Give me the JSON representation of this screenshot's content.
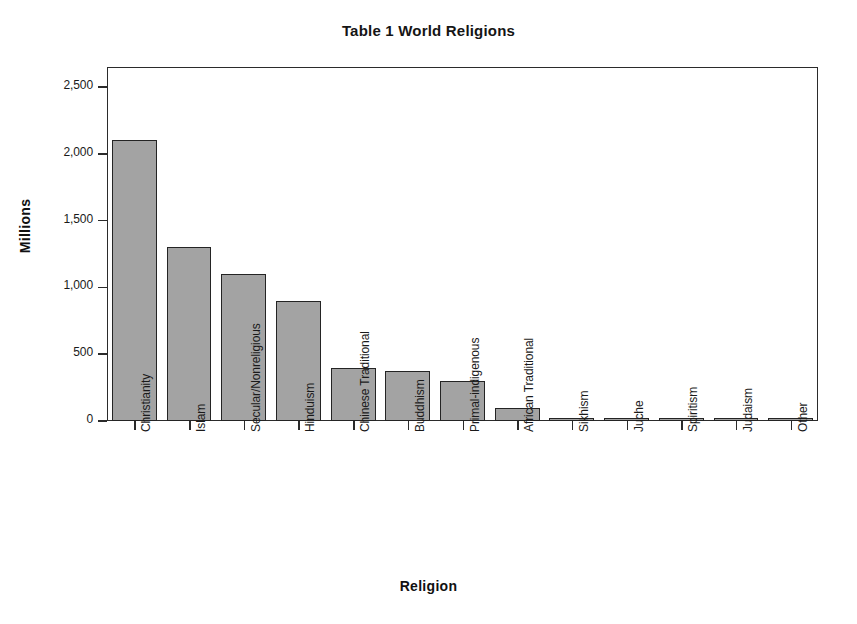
{
  "chart_data": {
    "type": "bar",
    "title": "Table 1 World Religions",
    "xlabel": "Religion",
    "ylabel": "Millions",
    "ylim": [
      0,
      2650
    ],
    "yticks": [
      0,
      500,
      1000,
      1500,
      2000,
      2500
    ],
    "ytick_labels": [
      "0",
      "500",
      "1,000",
      "1,500",
      "2,000",
      "2,500"
    ],
    "grid": false,
    "legend": false,
    "bar_fill_color": "#a3a3a3",
    "bar_edge_color": "#242424",
    "categories": [
      "Christianity",
      "Islam",
      "Secular/Nonreligious",
      "Hinduism",
      "Chinese Traditional",
      "Buddhism",
      "Primal-indigenous",
      "African Traditional",
      "Sikhism",
      "Juche",
      "Spiritism",
      "Judaism",
      "Other"
    ],
    "values": [
      2100,
      1300,
      1100,
      900,
      394,
      376,
      300,
      100,
      23,
      19,
      15,
      14,
      25
    ]
  }
}
